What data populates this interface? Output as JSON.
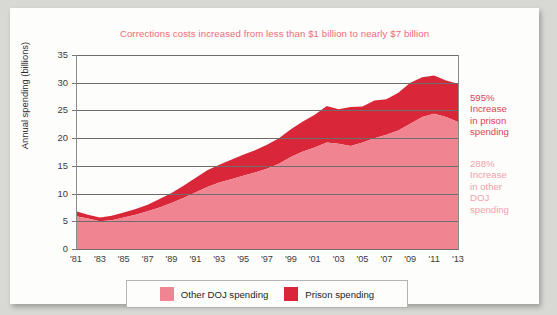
{
  "chart_data": {
    "type": "area",
    "stacked": true,
    "title": "Corrections costs increased from less than $1 billion to nearly $7 billion",
    "xlabel": "",
    "ylabel": "Annual spending (billions)",
    "ylim": [
      0,
      35
    ],
    "ytick_labels": [
      "35",
      "30",
      "25",
      "20",
      "15",
      "10",
      "5",
      "0"
    ],
    "ytick_values": [
      35,
      30,
      25,
      20,
      15,
      10,
      5,
      0
    ],
    "grid": true,
    "legend_position": "bottom",
    "x": [
      1981,
      1982,
      1983,
      1984,
      1985,
      1986,
      1987,
      1988,
      1989,
      1990,
      1991,
      1992,
      1993,
      1994,
      1995,
      1996,
      1997,
      1998,
      1999,
      2000,
      2001,
      2002,
      2003,
      2004,
      2005,
      2006,
      2007,
      2008,
      2009,
      2010,
      2011,
      2012,
      2013
    ],
    "xtick_labels": [
      "'81",
      "'83",
      "'85",
      "'87",
      "'89",
      "'91",
      "'93",
      "'95",
      "'97",
      "'99",
      "'01",
      "'03",
      "'05",
      "'07",
      "'09",
      "'11",
      "'13"
    ],
    "xtick_values": [
      1981,
      1983,
      1985,
      1987,
      1989,
      1991,
      1993,
      1995,
      1997,
      1999,
      2001,
      2003,
      2005,
      2007,
      2009,
      2011,
      2013
    ],
    "series": [
      {
        "name": "Other DOJ spending",
        "color": "#f08490",
        "values": [
          5.9,
          5.5,
          5.0,
          5.2,
          5.7,
          6.2,
          6.8,
          7.5,
          8.3,
          9.2,
          10.2,
          11.2,
          12.0,
          12.6,
          13.2,
          13.8,
          14.5,
          15.4,
          16.6,
          17.6,
          18.3,
          19.2,
          19.0,
          18.6,
          19.2,
          20.0,
          20.6,
          21.4,
          22.6,
          23.8,
          24.4,
          23.8,
          22.9
        ]
      },
      {
        "name": "Prison spending",
        "color": "#d92739",
        "values": [
          0.9,
          0.7,
          0.7,
          0.8,
          0.9,
          1.0,
          1.2,
          1.5,
          1.8,
          2.2,
          2.6,
          3.0,
          3.2,
          3.5,
          3.8,
          4.0,
          4.3,
          4.6,
          5.0,
          5.4,
          5.9,
          6.6,
          6.2,
          7.0,
          6.5,
          6.8,
          6.4,
          6.8,
          7.4,
          7.2,
          6.9,
          6.6,
          6.9
        ]
      }
    ],
    "totals": [
      6.8,
      6.2,
      5.7,
      6.0,
      6.6,
      7.2,
      8.0,
      9.0,
      10.1,
      11.4,
      12.8,
      14.2,
      15.2,
      16.1,
      17.0,
      17.8,
      18.8,
      20.0,
      21.6,
      23.0,
      24.2,
      25.8,
      25.2,
      25.6,
      25.7,
      26.8,
      27.0,
      28.2,
      30.0,
      31.0,
      31.3,
      30.4,
      29.8
    ],
    "annotations": [
      {
        "id": "prison-growth",
        "percent": "595%",
        "line1": "Increase",
        "line2": "in prison",
        "line3": "spending",
        "color": "#e2405a"
      },
      {
        "id": "other-doj-growth",
        "percent": "288%",
        "line1": "Increase",
        "line2": "in other",
        "line3": "DOJ",
        "line4": "spending",
        "color": "#f3a0ab"
      }
    ]
  },
  "legend": {
    "items": [
      {
        "label": "Other DOJ spending",
        "color": "#f08490"
      },
      {
        "label": "Prison spending",
        "color": "#d92739"
      }
    ]
  },
  "colors": {
    "title": "#ef6a7a",
    "light_band": "#f08490",
    "dark_band": "#d92739",
    "grid": "#6d6d6d",
    "card_bg": "#fdfdfb",
    "page_bg": "#d8d8d4"
  }
}
